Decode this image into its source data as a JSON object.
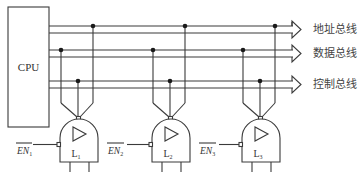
{
  "cpu": {
    "label": "CPU"
  },
  "buses": [
    {
      "label": "地址总线",
      "y1": 26,
      "y2": 33
    },
    {
      "label": "数据总线",
      "y1": 50,
      "y2": 57
    },
    {
      "label": "控制总线",
      "y1": 81,
      "y2": 88
    }
  ],
  "gates": [
    {
      "id": "L1",
      "label": "L",
      "sub": "1",
      "en_label": "EN",
      "en_sub": "1"
    },
    {
      "id": "L2",
      "label": "L",
      "sub": "2",
      "en_label": "EN",
      "en_sub": "2"
    },
    {
      "id": "L3",
      "label": "L",
      "sub": "3",
      "en_label": "EN",
      "en_sub": "3"
    }
  ],
  "colors": {
    "line": "#3a3a3a",
    "text": "#333333",
    "background": "#ffffff"
  }
}
